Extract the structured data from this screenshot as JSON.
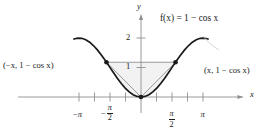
{
  "figure": {
    "function_label": "f(x) = 1 − cos x",
    "axis_x_letter": "x",
    "axis_y_letter": "y",
    "point_label_left": "(−x, 1 − cos x)",
    "point_label_right": "(x, 1 − cos x)",
    "y_ticks": [
      {
        "label": "1",
        "value": 1
      },
      {
        "label": "2",
        "value": 2
      }
    ],
    "x_ticks": [
      {
        "label": "−π",
        "value": -3.14159,
        "style": "plain",
        "num": "π",
        "den": "",
        "negative": true
      },
      {
        "label": "",
        "value": -2.35619,
        "style": "none",
        "num": "",
        "den": "",
        "negative": false
      },
      {
        "label": "−π/2",
        "value": -1.5708,
        "style": "fraction",
        "num": "π",
        "den": "2",
        "negative": true
      },
      {
        "label": "",
        "value": -0.7854,
        "style": "none",
        "num": "",
        "den": "",
        "negative": false
      },
      {
        "label": "",
        "value": 0.7854,
        "style": "none",
        "num": "",
        "den": "",
        "negative": false
      },
      {
        "label": "π/2",
        "value": 1.5708,
        "style": "fraction",
        "num": "π",
        "den": "2",
        "negative": false
      },
      {
        "label": "",
        "value": 2.35619,
        "style": "none",
        "num": "",
        "den": "",
        "negative": false
      },
      {
        "label": "π",
        "value": 3.14159,
        "style": "plain",
        "num": "π",
        "den": "",
        "negative": false
      }
    ],
    "colors": {
      "curve": "#1a1a1a",
      "axis": "#8e8e8e",
      "chord": "#8e8e8e",
      "shade": "#f2f2f2",
      "marker": "#1a1a1a",
      "text": "#1a1a1a"
    }
  },
  "chart_data": {
    "type": "line",
    "title": "",
    "xlabel": "x",
    "ylabel": "y",
    "xlim": [
      -3.6,
      3.6
    ],
    "ylim": [
      -0.35,
      2.55
    ],
    "grid": false,
    "legend": "none",
    "annotations": [
      "f(x) = 1 − cos x",
      "(−x, 1 − cos x)",
      "(x, 1 − cos x)"
    ],
    "series": [
      {
        "name": "f(x) = 1 - cos x",
        "type": "curve",
        "color": "#1a1a1a",
        "x": [
          -3.4,
          -3.2,
          -3.0,
          -2.8,
          -2.6,
          -2.4,
          -2.2,
          -2.0,
          -1.8,
          -1.6,
          -1.4,
          -1.2,
          -1.0,
          -0.8,
          -0.6,
          -0.4,
          -0.2,
          0.0,
          0.2,
          0.4,
          0.6,
          0.8,
          1.0,
          1.2,
          1.4,
          1.6,
          1.8,
          2.0,
          2.2,
          2.4,
          2.6,
          2.8,
          3.0,
          3.2,
          3.4
        ],
        "y": [
          1.967,
          1.998,
          1.99,
          1.942,
          1.857,
          1.737,
          1.589,
          1.416,
          1.227,
          1.029,
          0.83,
          0.638,
          0.46,
          0.303,
          0.175,
          0.079,
          0.02,
          0.0,
          0.02,
          0.079,
          0.175,
          0.303,
          0.46,
          0.638,
          0.83,
          1.029,
          1.227,
          1.416,
          1.589,
          1.737,
          1.857,
          1.942,
          1.99,
          1.998,
          1.967
        ]
      },
      {
        "name": "chord through (-x, 1-cos x) and (x, 1-cos x)",
        "type": "segment",
        "color": "#8e8e8e",
        "x": [
          -1.75,
          1.75
        ],
        "y": [
          1.178,
          1.178
        ]
      },
      {
        "name": "left side of triangle to origin",
        "type": "segment",
        "color": "#8e8e8e",
        "x": [
          -1.75,
          0.0
        ],
        "y": [
          1.178,
          0.0
        ]
      },
      {
        "name": "right side of triangle to origin",
        "type": "segment",
        "color": "#8e8e8e",
        "x": [
          1.75,
          0.0
        ],
        "y": [
          1.178,
          0.0
        ]
      }
    ],
    "markers": [
      {
        "label": "(−x, 1 − cos x)",
        "x": -1.75,
        "y": 1.178
      },
      {
        "label": "(x, 1 − cos x)",
        "x": 1.75,
        "y": 1.178
      },
      {
        "label": "origin",
        "x": 0.0,
        "y": 0.0
      }
    ],
    "shaded_region": {
      "description": "region between the chord, the two straight segments to the origin and the cosine curve",
      "fill": "#f2f2f2"
    }
  }
}
